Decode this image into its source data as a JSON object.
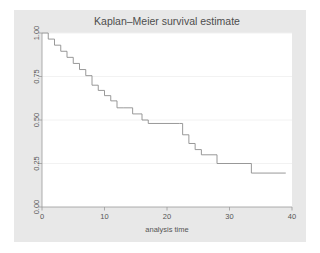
{
  "figure": {
    "background_color": "#e8e8e8",
    "plot_background_color": "#ffffff",
    "axis_color": "#9a9a9a",
    "grid_color": "#f0f0f0",
    "curve_color": "#8d8d8d",
    "text_color": "#555555"
  },
  "chart_data": {
    "type": "line",
    "title": "Kaplan–Meier survival estimate",
    "xlabel": "analysis time",
    "ylabel": "",
    "xlim": [
      0,
      40
    ],
    "ylim": [
      0,
      1
    ],
    "xticks": [
      0,
      10,
      20,
      30,
      40
    ],
    "xticklabels": [
      "0",
      "10",
      "20",
      "30",
      "40"
    ],
    "yticks": [
      0.0,
      0.25,
      0.5,
      0.75,
      1.0
    ],
    "yticklabels": [
      "0.00",
      "0.25",
      "0.50",
      "0.75",
      "1.00"
    ],
    "grid": "horizontal",
    "legend": "none",
    "step": "post",
    "series": [
      {
        "name": "survival",
        "x": [
          0,
          1.0,
          2.0,
          3.0,
          4.0,
          5.0,
          6.0,
          7.0,
          8.0,
          9.0,
          10.0,
          11.0,
          12.0,
          13.0,
          14.5,
          16.0,
          17.0,
          22.0,
          22.5,
          23.5,
          24.5,
          25.5,
          28.0,
          33.5,
          39.0
        ],
        "y": [
          1.0,
          0.965,
          0.93,
          0.895,
          0.86,
          0.825,
          0.79,
          0.755,
          0.7,
          0.67,
          0.64,
          0.61,
          0.57,
          0.57,
          0.535,
          0.5,
          0.48,
          0.48,
          0.415,
          0.365,
          0.33,
          0.3,
          0.25,
          0.195,
          0.195
        ]
      }
    ]
  }
}
